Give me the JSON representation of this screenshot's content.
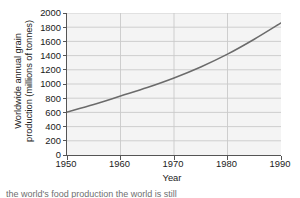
{
  "chart_data": {
    "type": "line",
    "title": "",
    "xlabel": "Year",
    "ylabel": "Worldwide annual grain production (millions of tonnes)",
    "ylabel_line1": "Worldwide annual grain",
    "ylabel_line2": "production (millions of tonnes)",
    "xlim": [
      1950,
      1990
    ],
    "ylim": [
      0,
      2000
    ],
    "xticks": [
      1950,
      1960,
      1970,
      1980,
      1990
    ],
    "yticks": [
      0,
      200,
      400,
      600,
      800,
      1000,
      1200,
      1400,
      1600,
      1800,
      2000
    ],
    "grid": "horizontal-and-vertical",
    "legend": "none",
    "series": [
      {
        "name": "Worldwide annual grain production",
        "color": "#6b6b6b",
        "x": [
          1950,
          1955,
          1960,
          1965,
          1970,
          1975,
          1980,
          1985,
          1990
        ],
        "values": [
          605,
          710,
          830,
          950,
          1085,
          1240,
          1420,
          1630,
          1860
        ]
      }
    ],
    "colors": {
      "line": "#6b6b6b",
      "plot_background": "#f4f4f4",
      "gridline": "#c9c9c9",
      "axis": "#555555",
      "text": "#1a1a1a"
    }
  },
  "caption": {
    "text": "the world's food production the world is still"
  }
}
